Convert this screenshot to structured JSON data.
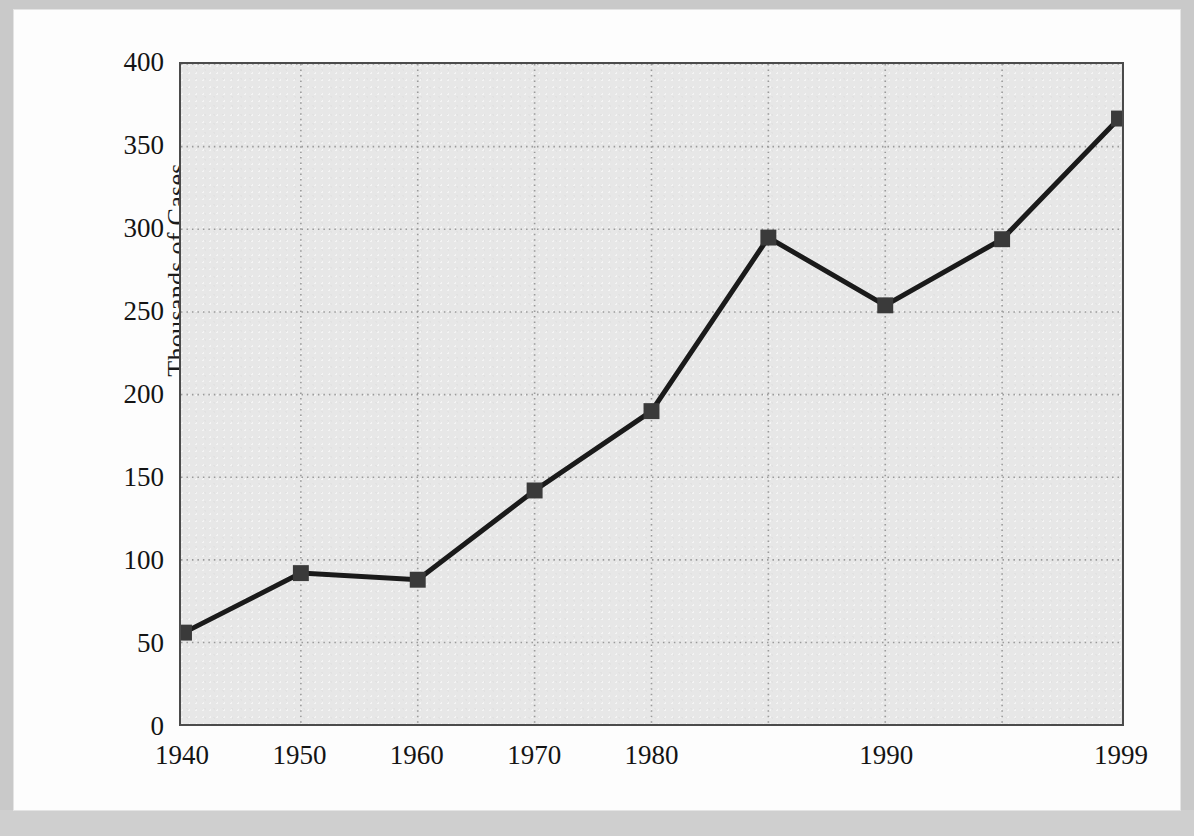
{
  "figure": {
    "y_axis_title": "Thousands of Cases"
  },
  "chart_data": {
    "type": "line",
    "title": "",
    "subtitle": "",
    "xlabel": "",
    "ylabel": "Thousands of Cases",
    "categories": [
      "1940",
      "1950",
      "1960",
      "1970",
      "1980",
      "1985",
      "1990",
      "1995",
      "1999"
    ],
    "tick_labels_shown": [
      "1940",
      "1950",
      "1960",
      "1970",
      "1980",
      "",
      "1990",
      "",
      "1999"
    ],
    "values": [
      56,
      92,
      88,
      142,
      190,
      295,
      254,
      294,
      367
    ],
    "series": [
      {
        "name": "Thousands of Cases",
        "values": [
          56,
          92,
          88,
          142,
          190,
          295,
          254,
          294,
          367
        ]
      }
    ],
    "ylim": [
      0,
      400
    ],
    "yticks": [
      0,
      50,
      100,
      150,
      200,
      250,
      300,
      350,
      400
    ],
    "ytick_labels": [
      "0",
      "50",
      "100",
      "150",
      "200",
      "250",
      "300",
      "350",
      "400"
    ],
    "grid": true,
    "grid_style": "dotted",
    "legend": "none",
    "marker": "square",
    "line_color": "#1a1a1a",
    "marker_color": "#3a3a3a",
    "plot_background": "#e7e7e7",
    "grid_color": "#9a9a9a",
    "axis_color": "#4b4b4b"
  }
}
